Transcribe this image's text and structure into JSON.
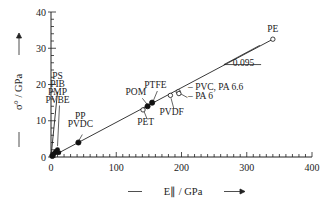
{
  "chart_data": {
    "type": "scatter",
    "title": "",
    "xlabel": "E∥ / GPa",
    "ylabel": "σ° / GPa",
    "xlim": [
      0,
      400
    ],
    "ylim": [
      0,
      40
    ],
    "x_ticks": [
      "0",
      "100",
      "200",
      "300",
      "400"
    ],
    "y_ticks": [
      "0",
      "10",
      "20",
      "30",
      "40"
    ],
    "grid": false,
    "legend": null,
    "series": [
      {
        "name": "filled",
        "marker": "filled-circle",
        "points": [
          {
            "label": "PS/PIB/PMP/PVBE",
            "x": 8,
            "y": 1.5
          },
          {
            "label": "PP/PVDC",
            "x": 42,
            "y": 4
          },
          {
            "label": "POM",
            "x": 148,
            "y": 14
          },
          {
            "label": "PTFE",
            "x": 155,
            "y": 15
          },
          {
            "label": "origin",
            "x": 2,
            "y": 0.3
          }
        ]
      },
      {
        "name": "open",
        "marker": "open-circle",
        "points": [
          {
            "label": "PET",
            "x": 141,
            "y": 13
          },
          {
            "label": "PVDF",
            "x": 183,
            "y": 17
          },
          {
            "label": "PVC, PA 6.6",
            "x": 195,
            "y": 18
          },
          {
            "label": "PA 6",
            "x": 196,
            "y": 17.5
          },
          {
            "label": "PE",
            "x": 340,
            "y": 32.5
          }
        ]
      }
    ],
    "fit_lines": [
      {
        "name": "main",
        "from": [
          0,
          0
        ],
        "to": [
          340,
          32.5
        ],
        "slope": 0.095
      },
      {
        "name": "steep",
        "from": [
          0,
          0
        ],
        "to": [
          10,
          18
        ]
      }
    ],
    "annotations": [
      {
        "text": "PE",
        "x": 340,
        "y": 34.5
      },
      {
        "text": "0.095",
        "x": 295,
        "y": 25
      },
      {
        "text": "PS",
        "x": 10,
        "y": 21.5
      },
      {
        "text": "PIB",
        "x": 10,
        "y": 19.3
      },
      {
        "text": "PMP",
        "x": 10,
        "y": 17.1
      },
      {
        "text": "PVBE",
        "x": 10,
        "y": 14.9
      },
      {
        "text": "PP",
        "x": 45,
        "y": 10.5
      },
      {
        "text": "PVDC",
        "x": 45,
        "y": 8.3
      },
      {
        "text": "POM",
        "x": 130,
        "y": 17
      },
      {
        "text": "PTFE",
        "x": 160,
        "y": 19
      },
      {
        "text": "PET",
        "x": 145,
        "y": 8.8
      },
      {
        "text": "PVDF",
        "x": 185,
        "y": 11.5
      },
      {
        "text": "– PVC, PA 6.6",
        "x": 210,
        "y": 18.5
      },
      {
        "text": "– PA 6",
        "x": 210,
        "y": 16
      }
    ]
  }
}
